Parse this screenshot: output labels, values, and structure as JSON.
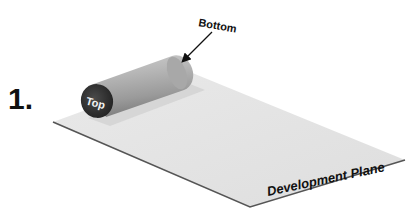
{
  "figure": {
    "step_number": "1.",
    "labels": {
      "top": "Top",
      "bottom": "Bottom",
      "plane": "Development Plane"
    },
    "colors": {
      "background": "#ffffff",
      "plane_fill": "#e6e6e6",
      "plane_edge": "#555555",
      "cylinder_light": "#d4d4d4",
      "cylinder_dark": "#8a8a8a",
      "top_face": "#3a3a3a",
      "text": "#111111"
    }
  }
}
